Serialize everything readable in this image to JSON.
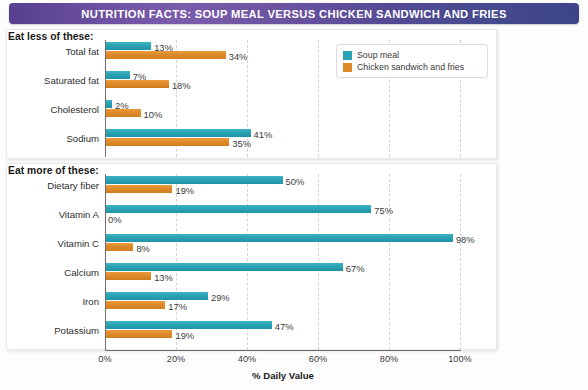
{
  "header": {
    "title": "NUTRITION FACTS:  SOUP MEAL VERSUS CHICKEN SANDWICH AND FRIES",
    "gradient_from": "#56408f",
    "gradient_to": "#3d4488"
  },
  "sections": {
    "eat_less_label": "Eat less of these:",
    "eat_more_label": "Eat more of these:"
  },
  "legend": {
    "items": [
      {
        "label": "Soup meal",
        "color": "#2aa3b4",
        "swatch": "teal"
      },
      {
        "label": "Chicken sandwich and fries",
        "color": "#df8a2a",
        "swatch": "orange"
      }
    ]
  },
  "axis": {
    "xlabel": "% Daily Value",
    "ticks": [
      "0%",
      "20%",
      "40%",
      "60%",
      "80%",
      "100%"
    ],
    "tick_values": [
      0,
      20,
      40,
      60,
      80,
      100
    ],
    "xmin": 0,
    "xmax": 100
  },
  "chart_data": {
    "type": "bar",
    "orientation": "horizontal",
    "title": "NUTRITION FACTS:  SOUP MEAL VERSUS CHICKEN SANDWICH AND FRIES",
    "xlabel": "% Daily Value",
    "ylabel": "",
    "xlim": [
      0,
      100
    ],
    "grid": true,
    "grid_style": "dashed-vertical",
    "legend_position": "top-right",
    "series": [
      {
        "name": "Soup meal",
        "color": "#2aa3b4"
      },
      {
        "name": "Chicken sandwich and fries",
        "color": "#df8a2a"
      }
    ],
    "panels": [
      {
        "panel_label": "Eat less of these:",
        "categories": [
          "Total fat",
          "Saturated fat",
          "Cholesterol",
          "Sodium"
        ],
        "series": [
          {
            "name": "Soup meal",
            "values": [
              13,
              7,
              2,
              41
            ],
            "labels": [
              "13%",
              "7%",
              "2%",
              "41%"
            ]
          },
          {
            "name": "Chicken sandwich and fries",
            "values": [
              34,
              18,
              10,
              35
            ],
            "labels": [
              "34%",
              "18%",
              "10%",
              "35%"
            ]
          }
        ]
      },
      {
        "panel_label": "Eat more of these:",
        "categories": [
          "Dietary fiber",
          "Vitamin A",
          "Vitamin C",
          "Calcium",
          "Iron",
          "Potassium"
        ],
        "series": [
          {
            "name": "Soup meal",
            "values": [
              50,
              75,
              98,
              67,
              29,
              47
            ],
            "labels": [
              "50%",
              "75%",
              "98%",
              "67%",
              "29%",
              "47%"
            ]
          },
          {
            "name": "Chicken sandwich and fries",
            "values": [
              19,
              0,
              8,
              13,
              17,
              19
            ],
            "labels": [
              "19%",
              "0%",
              "8%",
              "13%",
              "17%",
              "19%"
            ]
          }
        ]
      }
    ]
  }
}
